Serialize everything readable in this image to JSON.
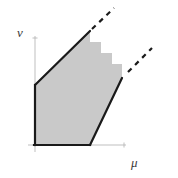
{
  "figure": {
    "background_color": "#ffffff",
    "width": 178,
    "height": 178
  },
  "axes": {
    "horizontal": {
      "name": "mu-axis",
      "label": "μ",
      "label_text": "mu",
      "thin_color": "#b8b8b8",
      "thin_from": [
        28,
        145
      ],
      "thin_to": [
        126,
        145
      ],
      "bold_color": "#1a1a1a",
      "bold_from": [
        35,
        145
      ],
      "bold_to": [
        90,
        145
      ],
      "bold_width": 2.2,
      "thin_width": 0.9
    },
    "vertical": {
      "name": "nu-axis",
      "label": "ν",
      "label_text": "nu",
      "thin_color": "#b8b8b8",
      "thin_from": [
        35,
        152
      ],
      "thin_to": [
        35,
        36
      ],
      "bold_color": "#1a1a1a",
      "bold_from": [
        35,
        145
      ],
      "bold_to": [
        35,
        85
      ],
      "bold_width": 2.2,
      "thin_width": 0.9
    },
    "origin": [
      35,
      145
    ]
  },
  "region": {
    "name": "shaded-region",
    "fill_color": "#c9c9c9",
    "outline_color": "#1a1a1a",
    "outline_width": 2.2,
    "polygon_points": "35,145 35,85 90,31 90,42 101,42 101,53 112,53 112,64 122,64 122,78 90,145",
    "vertices": [
      [
        35,
        145
      ],
      [
        35,
        85
      ],
      [
        90,
        31
      ],
      [
        90,
        42
      ],
      [
        101,
        42
      ],
      [
        101,
        53
      ],
      [
        112,
        53
      ],
      [
        112,
        64
      ],
      [
        122,
        64
      ],
      [
        122,
        78
      ],
      [
        90,
        145
      ]
    ],
    "staircase_steps": 4,
    "staircase_description": "descending steps from upper-left diagonal apex to lower-right diagonal apex"
  },
  "boundaries": {
    "upper_diagonal": {
      "name": "upper-boundary-line",
      "solid_from": [
        35,
        85
      ],
      "solid_to": [
        90,
        31
      ],
      "color": "#1a1a1a",
      "width": 2.2
    },
    "upper_dashed": {
      "name": "upper-dashed-extension",
      "from": [
        92,
        29
      ],
      "to": [
        114,
        8
      ],
      "color": "#1a1a1a",
      "width": 2.2,
      "dash": "5 5"
    },
    "lower_diagonal": {
      "name": "lower-boundary-line",
      "solid_from": [
        90,
        145
      ],
      "solid_to": [
        122,
        78
      ],
      "color": "#1a1a1a",
      "width": 2.2
    },
    "lower_dashed": {
      "name": "lower-dashed-extension",
      "from": [
        128,
        72
      ],
      "to": [
        152,
        48
      ],
      "color": "#1a1a1a",
      "width": 2.2,
      "dash": "5 5"
    },
    "staircase_outline": {
      "name": "staircase-boundary",
      "points": "90,31 90,42 101,42 101,53 112,53 112,64 122,64 122,78",
      "color": "#1a1a1a",
      "width": 1.0,
      "visible": false
    }
  },
  "ticks": {
    "mu_end_tick": {
      "name": "mu-axis-end-tick",
      "at": [
        124,
        145
      ],
      "color": "#b8b8b8"
    },
    "nu_end_tick": {
      "name": "nu-axis-end-tick",
      "at": [
        35,
        38
      ],
      "color": "#b8b8b8"
    }
  }
}
